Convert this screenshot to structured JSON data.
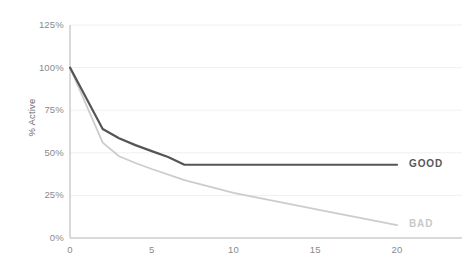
{
  "chart_data": {
    "type": "line",
    "title": "",
    "xlabel": "",
    "ylabel": "% Active",
    "xlim": [
      0,
      20
    ],
    "ylim": [
      0,
      125
    ],
    "grid": true,
    "grid_axis": "y",
    "legend_position": "right-inline",
    "x_ticks": [
      "0",
      "5",
      "10",
      "15",
      "20"
    ],
    "x_tick_values": [
      0,
      5,
      10,
      15,
      20
    ],
    "y_ticks": [
      "0%",
      "25%",
      "50%",
      "75%",
      "100%",
      "125%"
    ],
    "y_tick_values": [
      0,
      25,
      50,
      75,
      100,
      125
    ],
    "series": [
      {
        "name": "GOOD",
        "color": "#555555",
        "width": 2.2,
        "label": "GOOD",
        "x": [
          0,
          2,
          3,
          4,
          5,
          6,
          7,
          10,
          15,
          20
        ],
        "values": [
          100,
          64,
          58.5,
          54.5,
          51,
          47.5,
          43,
          43,
          43,
          43
        ]
      },
      {
        "name": "BAD",
        "color": "#cccccc",
        "width": 1.8,
        "label": "BAD",
        "x": [
          0,
          2,
          3,
          4,
          5,
          7,
          10,
          15,
          20
        ],
        "values": [
          100,
          56,
          48,
          44,
          40.5,
          34,
          26.5,
          17,
          7.5
        ]
      }
    ]
  },
  "axis": {
    "y_label": "% Active",
    "ticks_y": [
      "125%",
      "100%",
      "75%",
      "50%",
      "25%",
      "0%"
    ],
    "ticks_x": [
      "0",
      "5",
      "10",
      "15",
      "20"
    ]
  },
  "labels": {
    "good": "GOOD",
    "bad": "BAD"
  },
  "colors": {
    "good_line": "#555555",
    "bad_line": "#cccccc",
    "axis": "#b4b4b4",
    "grid": "#f0f0f0",
    "tick_text": "#8a8a8a",
    "background": "#ffffff"
  }
}
